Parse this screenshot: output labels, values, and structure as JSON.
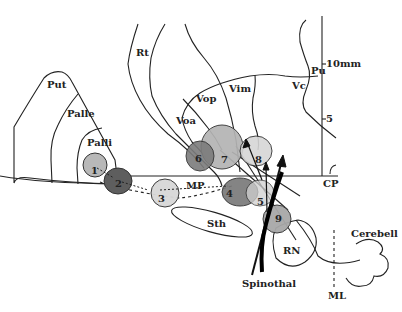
{
  "diagram": {
    "structures": {
      "put": "Put",
      "palle": "Palle",
      "palli": "Palli",
      "rt": "Rt",
      "voa": "Voa",
      "vop": "Vop",
      "vim": "Vim",
      "vc": "Vc",
      "pu": "Pu",
      "mp": "MP",
      "cp": "CP",
      "sth": "Sth",
      "rn": "RN",
      "cerebell": "Cerebell",
      "spinothal": "Spinothal",
      "ml": "ML"
    },
    "scale": {
      "tick_10": "10mm",
      "tick_5": "5"
    },
    "targets": [
      {
        "id": "1",
        "shade": "#b8b8b8"
      },
      {
        "id": "2",
        "shade": "#5a5a5a"
      },
      {
        "id": "3",
        "shade": "#d6d6d6"
      },
      {
        "id": "4",
        "shade": "#7a7a7a"
      },
      {
        "id": "5",
        "shade": "#d0d0d0"
      },
      {
        "id": "6",
        "shade": "#7c7c7c"
      },
      {
        "id": "7",
        "shade": "#b4b4b4"
      },
      {
        "id": "8",
        "shade": "#d4d4d4"
      },
      {
        "id": "9",
        "shade": "#a8a8a8"
      }
    ]
  }
}
